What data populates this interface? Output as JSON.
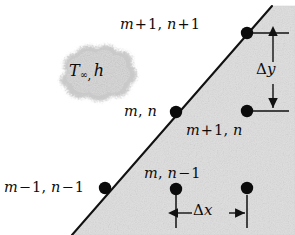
{
  "figure": {
    "colors": {
      "shaded_region": "#dedede",
      "line": "#111111",
      "node": "#0b0b0b",
      "cloud_fill": "#cfcfcf",
      "background": "#ffffff"
    },
    "nodes": [
      {
        "id": "node-m1-n1",
        "label_parts": {
          "m": "m",
          "op1": "+",
          "num1": "1",
          "comma": ",",
          "n": "n",
          "op2": "+",
          "num2": "1"
        },
        "label": "m + 1, n + 1",
        "x": 247,
        "y": 33,
        "on_surface": true
      },
      {
        "id": "node-m-n",
        "label_parts": {
          "m": "m",
          "comma": ",",
          "n": "n"
        },
        "label": "m, n",
        "x": 176,
        "y": 112,
        "on_surface": true
      },
      {
        "id": "node-mp1-n",
        "label_parts": {
          "m": "m",
          "op1": "+",
          "num1": "1",
          "comma": ",",
          "n": "n"
        },
        "label": "m + 1, n",
        "x": 247,
        "y": 111,
        "on_surface": false
      },
      {
        "id": "node-m-nm1",
        "label_parts": {
          "m": "m",
          "comma": ",",
          "n": "n",
          "op2": "−",
          "num2": "1"
        },
        "label": "m, n − 1",
        "x": 176,
        "y": 189,
        "on_surface": false
      },
      {
        "id": "node-mm1-nm1",
        "label_parts": {
          "m": "m",
          "op1": "−",
          "num1": "1",
          "comma": ",",
          "n": "n",
          "op2": "−",
          "num2": "1"
        },
        "label": "m − 1, n − 1",
        "x": 105,
        "y": 188,
        "on_surface": true
      },
      {
        "id": "node-mp1-nm1",
        "label_parts": {},
        "label": "",
        "x": 247,
        "y": 188,
        "on_surface": false
      }
    ],
    "cloud": {
      "name": "free-stream-fluid-cloud",
      "temperature_symbol": "T",
      "temperature_subscript": "∞",
      "separator": ",",
      "coefficient_symbol": "h",
      "label": "T∞, h"
    },
    "dimensions": [
      {
        "id": "dim-delta-y",
        "label": "Δy",
        "symbol_delta": "Δ",
        "symbol_axis": "y",
        "orientation": "vertical",
        "from_node": "node-m1-n1",
        "to_node": "node-mp1-n"
      },
      {
        "id": "dim-delta-x",
        "label": "Δx",
        "symbol_delta": "Δ",
        "symbol_axis": "x",
        "orientation": "horizontal",
        "from_node": "node-m-nm1",
        "to_node": "node-mp1-nm1"
      }
    ],
    "surface": {
      "name": "diagonal-convective-surface",
      "start": {
        "x": 72,
        "y": 235
      },
      "end": {
        "x": 272,
        "y": 6
      }
    }
  }
}
